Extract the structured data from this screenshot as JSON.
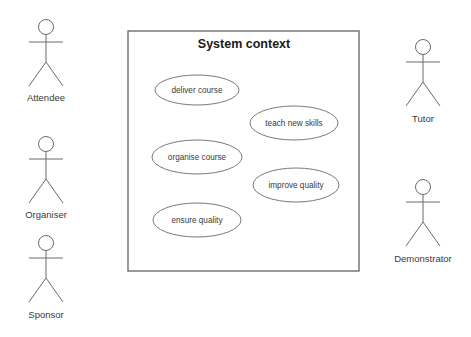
{
  "diagram": {
    "type": "uml-use-case-diagram",
    "canvas": {
      "width": 471,
      "height": 337,
      "background": "#ffffff"
    },
    "stroke_color": "#6b6b6b",
    "text_color": "#3a3a3a",
    "title_color": "#1a1a1a"
  },
  "system_boundary": {
    "title": "System context",
    "box": {
      "x": 128,
      "y": 31,
      "width": 231,
      "height": 240
    },
    "title_position": {
      "x": 244,
      "y": 48
    }
  },
  "actors": {
    "left": [
      {
        "label": "Attendee",
        "name": "actor-attendee",
        "cx": 46,
        "head_cy": 27,
        "head_r": 7.5,
        "arms_y": 42,
        "hip_y": 62,
        "feet_y": 86,
        "leg_spread": 17,
        "arm_spread": 17,
        "label_y": 101
      },
      {
        "label": "Organiser",
        "name": "actor-organiser",
        "cx": 46,
        "head_cy": 144,
        "head_r": 7.5,
        "arms_y": 159,
        "hip_y": 179,
        "feet_y": 203,
        "leg_spread": 17,
        "arm_spread": 17,
        "label_y": 218
      },
      {
        "label": "Sponsor",
        "name": "actor-sponsor",
        "cx": 46,
        "head_cy": 243,
        "head_r": 7.5,
        "arms_y": 258,
        "hip_y": 278,
        "feet_y": 302,
        "leg_spread": 17,
        "arm_spread": 17,
        "label_y": 318
      }
    ],
    "right": [
      {
        "label": "Tutor",
        "name": "actor-tutor",
        "cx": 423,
        "head_cy": 47,
        "head_r": 7.5,
        "arms_y": 62,
        "hip_y": 82,
        "feet_y": 106,
        "leg_spread": 17,
        "arm_spread": 17,
        "label_y": 122
      },
      {
        "label": "Demonstrator",
        "name": "actor-demonstrator",
        "cx": 423,
        "head_cy": 187,
        "head_r": 7.5,
        "arms_y": 202,
        "hip_y": 222,
        "feet_y": 246,
        "leg_spread": 17,
        "arm_spread": 17,
        "label_y": 262
      }
    ]
  },
  "use_cases": [
    {
      "label": "deliver course",
      "name": "use-case-deliver-course",
      "cx": 197,
      "cy": 90,
      "rx": 42,
      "ry": 15
    },
    {
      "label": "teach new skills",
      "name": "use-case-teach-new-skills",
      "cx": 294,
      "cy": 123,
      "rx": 44,
      "ry": 17
    },
    {
      "label": "organise course",
      "name": "use-case-organise-course",
      "cx": 197,
      "cy": 157,
      "rx": 45,
      "ry": 17
    },
    {
      "label": "improve quality",
      "name": "use-case-improve-quality",
      "cx": 296,
      "cy": 185,
      "rx": 43,
      "ry": 17
    },
    {
      "label": "ensure quality",
      "name": "use-case-ensure-quality",
      "cx": 197,
      "cy": 220,
      "rx": 44,
      "ry": 17
    }
  ]
}
